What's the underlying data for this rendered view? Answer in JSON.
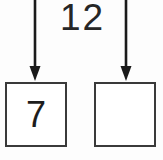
{
  "canvas": {
    "width": 163,
    "height": 160,
    "background_color": "#fdfdfd"
  },
  "top_number": {
    "value": "12"
  },
  "arrows": [
    {
      "name": "left-down-arrow",
      "direction": "down",
      "color": "#1a1a1a",
      "x": 35,
      "y_start": 0,
      "y_end": 80
    },
    {
      "name": "right-down-arrow",
      "direction": "down",
      "color": "#1a1a1a",
      "x": 126,
      "y_start": 0,
      "y_end": 80
    }
  ],
  "boxes": [
    {
      "name": "left-box",
      "value": "7",
      "filled": true,
      "border_color": "#3a3a3a"
    },
    {
      "name": "right-box",
      "value": "",
      "filled": false,
      "border_color": "#3a3a3a"
    }
  ]
}
